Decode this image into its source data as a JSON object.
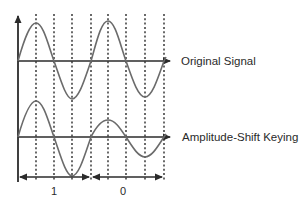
{
  "diagram": {
    "title": "Amplitude-Shift Keying",
    "signals": [
      {
        "name": "original",
        "label": "Original Signal"
      },
      {
        "name": "ask",
        "label": "Amplitude-Shift Keying"
      }
    ],
    "bits": [
      {
        "value": "1",
        "amplitude": "high"
      },
      {
        "value": "0",
        "amplitude": "low"
      }
    ],
    "colors": {
      "axis": "#2b2b2b",
      "wave": "#6b6b6b",
      "grid": "#2b2b2b",
      "text": "#2a2a2a",
      "background": "#ffffff"
    }
  }
}
